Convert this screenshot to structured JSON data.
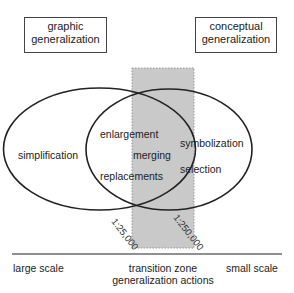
{
  "boxes": {
    "graphic": "graphic\ngeneralization",
    "conceptual": "conceptual\ngeneralization"
  },
  "left_ellipse": {
    "label": "simplification"
  },
  "overlap": {
    "items": [
      "enlargement",
      "merging",
      "replacements"
    ]
  },
  "right_ellipse": {
    "items": [
      "symbolization",
      "selection"
    ]
  },
  "scales": {
    "left_boundary": "1:25,000",
    "right_boundary": "1:250,000"
  },
  "axis": {
    "left": "large scale",
    "center_line1": "transition zone",
    "center_line2": "generalization actions",
    "right": "small scale"
  },
  "colors": {
    "zone_fill": "#c9c9c9",
    "stroke": "#222222"
  }
}
